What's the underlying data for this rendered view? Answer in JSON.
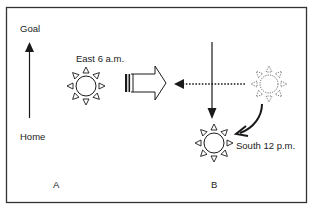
{
  "diagram": {
    "labels": {
      "goal": "Goal",
      "home": "Home",
      "east": "East 6 a.m.",
      "south": "South 12 p.m.",
      "panel_a": "A",
      "panel_b": "B"
    },
    "colors": {
      "stroke": "#1a1a1a",
      "dashed": "#555555",
      "border": "#333333",
      "background": "#ffffff"
    },
    "icons": {
      "east_sun": "sun-icon",
      "south_sun": "sun-icon",
      "faded_sun": "sun-dashed-icon",
      "direction_arrow": "hollow-right-arrow-icon"
    }
  }
}
